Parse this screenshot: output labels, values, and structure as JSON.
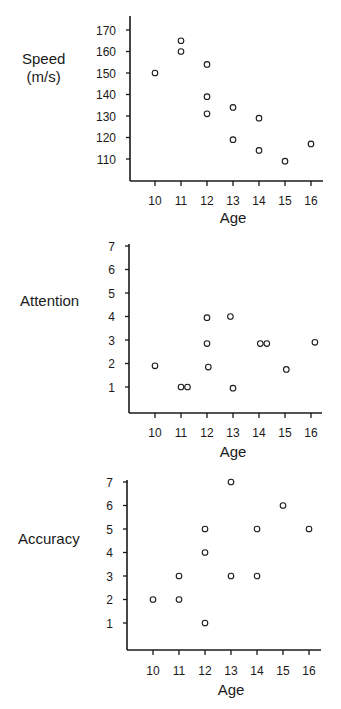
{
  "chart_data": [
    {
      "type": "scatter",
      "title": "",
      "xlabel": "Age",
      "ylabel": "Speed\n(m/s)",
      "ylabel_lines": [
        "Speed",
        "(m/s)"
      ],
      "x_ticks": [
        10,
        11,
        12,
        13,
        14,
        15,
        16
      ],
      "y_ticks": [
        110,
        120,
        130,
        140,
        150,
        160,
        170
      ],
      "xlim": [
        9.1,
        16.5
      ],
      "ylim": [
        98,
        177
      ],
      "grid": false,
      "marker": "open-circle",
      "points": [
        {
          "x": 10,
          "y": 150
        },
        {
          "x": 11,
          "y": 165
        },
        {
          "x": 11,
          "y": 160
        },
        {
          "x": 12,
          "y": 154
        },
        {
          "x": 12,
          "y": 139
        },
        {
          "x": 12,
          "y": 131
        },
        {
          "x": 13,
          "y": 134
        },
        {
          "x": 13,
          "y": 119
        },
        {
          "x": 14,
          "y": 129
        },
        {
          "x": 14,
          "y": 114
        },
        {
          "x": 15,
          "y": 109
        },
        {
          "x": 16,
          "y": 117
        }
      ]
    },
    {
      "type": "scatter",
      "title": "",
      "xlabel": "Age",
      "ylabel": "Attention",
      "ylabel_lines": [
        "Attention"
      ],
      "x_ticks": [
        10,
        11,
        12,
        13,
        14,
        15,
        16
      ],
      "y_ticks": [
        1,
        2,
        3,
        4,
        5,
        6,
        7
      ],
      "xlim": [
        9.1,
        16.5
      ],
      "ylim": [
        0,
        7
      ],
      "grid": false,
      "marker": "open-circle",
      "points": [
        {
          "x": 10,
          "y": 1.9
        },
        {
          "x": 11,
          "y": 1.0
        },
        {
          "x": 11.25,
          "y": 1.0
        },
        {
          "x": 12,
          "y": 3.95
        },
        {
          "x": 12,
          "y": 2.85
        },
        {
          "x": 12.05,
          "y": 1.85
        },
        {
          "x": 12.9,
          "y": 4.0
        },
        {
          "x": 13,
          "y": 0.95
        },
        {
          "x": 14.05,
          "y": 2.85
        },
        {
          "x": 14.3,
          "y": 2.85
        },
        {
          "x": 15.05,
          "y": 1.75
        },
        {
          "x": 16.15,
          "y": 2.9
        }
      ]
    },
    {
      "type": "scatter",
      "title": "",
      "xlabel": "Age",
      "ylabel": "Accuracy",
      "ylabel_lines": [
        "Accuracy"
      ],
      "x_ticks": [
        10,
        11,
        12,
        13,
        14,
        15,
        16
      ],
      "y_ticks": [
        1,
        2,
        3,
        4,
        5,
        6,
        7
      ],
      "xlim": [
        9.1,
        16.5
      ],
      "ylim": [
        0,
        7
      ],
      "grid": false,
      "marker": "open-circle",
      "points": [
        {
          "x": 10,
          "y": 2
        },
        {
          "x": 11,
          "y": 3
        },
        {
          "x": 11,
          "y": 2
        },
        {
          "x": 12,
          "y": 5
        },
        {
          "x": 12,
          "y": 4
        },
        {
          "x": 12,
          "y": 1
        },
        {
          "x": 13,
          "y": 7
        },
        {
          "x": 13,
          "y": 3
        },
        {
          "x": 14,
          "y": 5
        },
        {
          "x": 14,
          "y": 3
        },
        {
          "x": 15,
          "y": 6
        },
        {
          "x": 16,
          "y": 5
        }
      ]
    }
  ],
  "layout": {
    "panels": [
      {
        "top": 0,
        "axisX": 130,
        "axisRight": 323,
        "axisTop": 16,
        "axisBottom": 181,
        "x10": 155,
        "xStep": 26,
        "yPix": {
          "v0": 110,
          "p0": 159,
          "v1": 170,
          "p1": 30
        },
        "tickLabelY": 205,
        "xlabelY": 223,
        "ylabelLeft": 22,
        "ylabelTop": 51
      },
      {
        "top": 0,
        "axisX": 129,
        "axisRight": 322,
        "axisTop": 244,
        "axisBottom": 413,
        "x10": 155,
        "xStep": 26,
        "yPix": {
          "v0": 1,
          "p0": 387,
          "v1": 7,
          "p1": 246
        },
        "tickLabelY": 437,
        "xlabelY": 457,
        "ylabelLeft": 18,
        "ylabelTop": 293
      },
      {
        "top": 0,
        "axisX": 127,
        "axisRight": 321,
        "axisTop": 480,
        "axisBottom": 650,
        "x10": 153,
        "xStep": 26,
        "yPix": {
          "v0": 1,
          "p0": 623,
          "v1": 7,
          "p1": 482
        },
        "tickLabelY": 675,
        "xlabelY": 695,
        "ylabelLeft": 18,
        "ylabelTop": 530
      }
    ]
  }
}
